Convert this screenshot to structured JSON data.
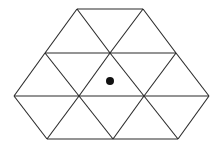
{
  "diagram": {
    "stroke_color": "#2a2a2a",
    "dot_color": "#111111",
    "vertices": {
      "row1": [
        [
          77,
          9
        ],
        [
          143,
          9
        ]
      ],
      "row2": [
        [
          45,
          53
        ],
        [
          110,
          53
        ],
        [
          176,
          53
        ]
      ],
      "row3": [
        [
          14,
          96
        ],
        [
          79,
          96
        ],
        [
          144,
          96
        ],
        [
          209,
          96
        ]
      ],
      "row4": [
        [
          47,
          139
        ],
        [
          113,
          139
        ],
        [
          178,
          139
        ]
      ]
    },
    "dot": {
      "cx": 110,
      "cy": 81,
      "r": 4
    }
  }
}
